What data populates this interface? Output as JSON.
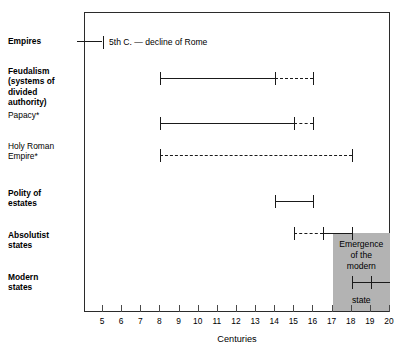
{
  "chart_data": {
    "type": "line",
    "title": "",
    "xlabel": "Centuries",
    "ylabel": "",
    "xlim": [
      4,
      20
    ],
    "xticks": [
      5,
      6,
      7,
      8,
      9,
      10,
      11,
      12,
      13,
      14,
      15,
      16,
      17,
      18,
      19,
      20
    ],
    "xtick_labels": [
      "5",
      "6",
      "7",
      "8",
      "9",
      "10",
      "11",
      "12",
      "13",
      "14",
      "15",
      "16",
      "17",
      "18",
      "19",
      "20"
    ],
    "grid": false,
    "legend": "none",
    "rows": [
      {
        "id": "empires",
        "label": "Empires",
        "bold": true,
        "segments": [
          {
            "from": 3.7,
            "to": 5,
            "style": "solid"
          }
        ],
        "caps": [
          5
        ],
        "note": "5th C. — decline of Rome"
      },
      {
        "id": "feudalism",
        "label": "Feudalism\n(systems of\ndivided\nauthority)",
        "bold": true,
        "segments": [
          {
            "from": 8,
            "to": 14,
            "style": "solid"
          },
          {
            "from": 14,
            "to": 16,
            "style": "dashed"
          }
        ],
        "caps": [
          8,
          14,
          16
        ],
        "note": ""
      },
      {
        "id": "papacy",
        "label": "Papacy*",
        "bold": false,
        "segments": [
          {
            "from": 8,
            "to": 15,
            "style": "solid"
          },
          {
            "from": 15,
            "to": 16,
            "style": "dashed"
          }
        ],
        "caps": [
          8,
          15,
          16
        ],
        "note": ""
      },
      {
        "id": "holy-roman-empire",
        "label": "Holy Roman\nEmpire*",
        "bold": false,
        "segments": [
          {
            "from": 8,
            "to": 18,
            "style": "dashed"
          }
        ],
        "caps": [
          8,
          18
        ],
        "note": ""
      },
      {
        "id": "polity-of-estates",
        "label": "Polity of\nestates",
        "bold": true,
        "segments": [
          {
            "from": 14,
            "to": 16,
            "style": "solid"
          }
        ],
        "caps": [
          14,
          16
        ],
        "note": ""
      },
      {
        "id": "absolutist-states",
        "label": "Absolutist\nstates",
        "bold": true,
        "segments": [
          {
            "from": 15,
            "to": 16.5,
            "style": "dashed"
          },
          {
            "from": 16.5,
            "to": 18,
            "style": "solid"
          }
        ],
        "caps": [
          15,
          16.5,
          18
        ],
        "note": ""
      },
      {
        "id": "modern-states",
        "label": "Modern\nstates",
        "bold": true,
        "segments": [
          {
            "from": 18,
            "to": 20,
            "style": "solid"
          }
        ],
        "caps": [
          18,
          19
        ],
        "note": ""
      }
    ],
    "shaded_region": {
      "label_lines": "Emergence\nof the\nmodern",
      "label_last_line": "state",
      "x_from": 17,
      "x_to": 20,
      "color": "#b3b3b3"
    },
    "footnote_marker": "*"
  },
  "colors": {
    "line": "#1a1a1a",
    "frame": "#2b2b2b",
    "shade": "#b3b3b3",
    "background": "#ffffff"
  }
}
